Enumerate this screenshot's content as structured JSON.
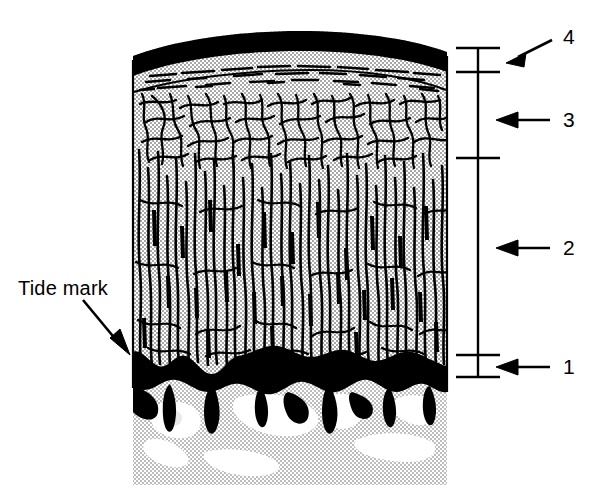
{
  "figure": {
    "type": "histological-schematic-diagram"
  },
  "annotations": {
    "tide_mark_label": "Tide mark"
  },
  "scale_bar": {
    "zone_labels": [
      {
        "id": "zone-4",
        "label": "4",
        "label_x": 563,
        "label_y": 37,
        "arrow_tip_x": 508,
        "arrow_tip_y": 62,
        "arrow_tail_x": 552,
        "arrow_tail_y": 42
      },
      {
        "id": "zone-3",
        "label": "3",
        "label_x": 563,
        "label_y": 110,
        "arrow_tip_x": 496,
        "arrow_tip_y": 120,
        "arrow_tail_x": 552,
        "arrow_tail_y": 120
      },
      {
        "id": "zone-2",
        "label": "2",
        "label_x": 563,
        "label_y": 238,
        "arrow_tip_x": 496,
        "arrow_tip_y": 248,
        "arrow_tail_x": 552,
        "arrow_tail_y": 248
      },
      {
        "id": "zone-1",
        "label": "1",
        "label_x": 563,
        "label_y": 357,
        "arrow_tip_x": 496,
        "arrow_tip_y": 367,
        "arrow_tail_x": 552,
        "arrow_tail_y": 367
      }
    ],
    "axis_x": 478,
    "axis_top": 48,
    "axis_bottom": 378,
    "ticks": [
      48,
      72,
      158,
      355,
      377
    ],
    "tick_half_width": 22
  },
  "specimen": {
    "left": 133,
    "right": 447,
    "top": 40,
    "bottom": 485,
    "layers": [
      {
        "name": "superficial-zone-band",
        "zone": 4,
        "top": 40,
        "bottom": 78,
        "fill": "#000000",
        "description": "dark superficial tangential band with horizontal fibre bundles"
      },
      {
        "name": "transitional-zone",
        "zone": 3,
        "top": 78,
        "bottom": 160,
        "fill": "#c9c9c9",
        "description": "arcade-like branching collagen fibres"
      },
      {
        "name": "radial-deep-zone",
        "zone": 2,
        "top": 160,
        "bottom": 348,
        "fill": "#c9c9c9",
        "description": "predominantly vertical radial collagen fibres"
      },
      {
        "name": "tide-mark-calcified-zone",
        "zone": 1,
        "top": 348,
        "bottom": 400,
        "fill": "#000000",
        "description": "irregular black tidemark / calcified cartilage border"
      },
      {
        "name": "subchondral-bone",
        "zone": 0,
        "top": 400,
        "bottom": 485,
        "fill": "#c9c9c9",
        "description": "subchondral bone with white marrow lacunae"
      }
    ]
  },
  "colors": {
    "ink": "#000000",
    "halftone_gray": "#c9c9c9",
    "halftone_dot": "#9a9a9a",
    "paper": "#ffffff",
    "void_white": "#ffffff"
  }
}
